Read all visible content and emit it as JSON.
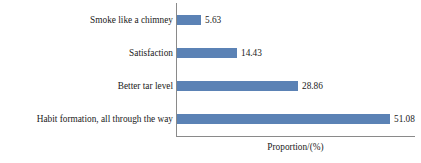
{
  "chart_data": {
    "type": "bar",
    "orientation": "horizontal",
    "title": "",
    "xlabel": "Proportion/(%)",
    "ylabel": "",
    "categories": [
      "Smoke like a chimney",
      "Satisfaction",
      "Better tar level",
      "Habit formation, all through the way"
    ],
    "values": [
      5.63,
      14.43,
      28.86,
      51.08
    ],
    "value_labels": [
      "5.63",
      "14.43",
      "28.86",
      "51.08"
    ],
    "xlim": [
      0,
      57
    ],
    "grid": false,
    "legend": false,
    "bar_color": "#5b82b5",
    "axis_color": "#8a8a8a"
  },
  "axis": {
    "x_title": "Proportion/(%)"
  }
}
